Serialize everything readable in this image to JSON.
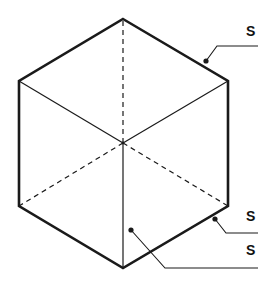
{
  "diagram": {
    "type": "isometric-cube",
    "colors": {
      "line": "#1a1a1a",
      "background": "#ffffff"
    },
    "vertices": {
      "top": [
        123,
        19
      ],
      "upper_left": [
        19,
        81
      ],
      "lower_left": [
        19,
        206
      ],
      "bottom": [
        123,
        268
      ],
      "lower_right": [
        228,
        206
      ],
      "upper_right": [
        228,
        81
      ],
      "center": [
        123,
        143
      ]
    },
    "labels": [
      {
        "id": "edge-label",
        "text": "S",
        "x": 246,
        "y": 24,
        "target": "top-right outer edge",
        "dot": [
          206,
          61
        ],
        "elbow": [
          217,
          46
        ],
        "end": [
          258,
          46
        ]
      },
      {
        "id": "lower-edge-label",
        "text": "S",
        "x": 246,
        "y": 209,
        "target": "bottom-right outer edge",
        "dot": [
          215,
          219
        ],
        "elbow": [
          226,
          233
        ],
        "end": [
          258,
          233
        ]
      },
      {
        "id": "face-label",
        "text": "S",
        "x": 246,
        "y": 243,
        "target": "front-right face",
        "dot": [
          131,
          230
        ],
        "elbow": [
          165,
          268
        ],
        "end": [
          258,
          268
        ]
      }
    ]
  }
}
